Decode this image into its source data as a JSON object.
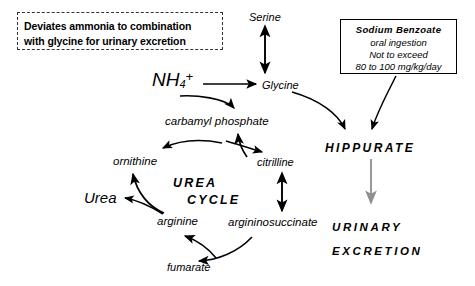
{
  "diagram": {
    "note_box": {
      "line1": "Deviates ammonia to combination",
      "line2": "with glycine for urinary excretion",
      "border_style": "dashed",
      "border_color": "#333333"
    },
    "drug_box": {
      "title": "Sodium  Benzoate",
      "line2": "oral  ingestion",
      "line3": "Not to exceed",
      "line4": "80 to 100 mg/kg/day",
      "border_style": "solid",
      "border_color": "#000000"
    },
    "nodes": {
      "serine": "Serine",
      "glycine": "Glycine",
      "ammonium": "NH",
      "ammonium_sub": "4",
      "ammonium_sup": "+",
      "carbamyl_phosphate": "carbamyl  phosphate",
      "ornithine": "ornithine",
      "citrulline": "citrilline",
      "arginine": "arginine",
      "argininosuccinate": "argininosuccinate",
      "fumarate": "fumarate",
      "urea": "Urea",
      "cycle_label_line1": "UREA",
      "cycle_label_line2": "CYCLE",
      "hippurate": "HIPPURATE",
      "urinary_line1": "URINARY",
      "urinary_line2": "EXCRETION"
    },
    "colors": {
      "ink": "#000000",
      "grey_arrow": "#9a9a9a",
      "background": "#ffffff"
    },
    "edges": [
      {
        "from": "serine",
        "to": "glycine",
        "type": "double-headed-straight"
      },
      {
        "from": "ammonium",
        "to": "glycine",
        "type": "straight"
      },
      {
        "from": "ammonium",
        "to": "carbamyl_phosphate",
        "type": "curved"
      },
      {
        "from": "glycine",
        "to": "hippurate",
        "type": "curved"
      },
      {
        "from": "drug_box",
        "to": "hippurate",
        "type": "curved"
      },
      {
        "from": "hippurate",
        "to": "urinary_excretion",
        "type": "straight-grey"
      },
      {
        "from": "carbamyl_phosphate",
        "to": "citrulline",
        "type": "curved"
      },
      {
        "from": "citrulline",
        "to": "carbamyl_phosphate",
        "type": "curved"
      },
      {
        "from": "carbamyl_phosphate",
        "to": "ornithine",
        "type": "curved"
      },
      {
        "from": "citrulline",
        "to": "argininosuccinate",
        "type": "double-headed-straight"
      },
      {
        "from": "argininosuccinate",
        "to": "fumarate",
        "type": "curved"
      },
      {
        "from": "fumarate",
        "to": "arginine",
        "type": "curved"
      },
      {
        "from": "arginine",
        "to": "ornithine",
        "type": "curved"
      },
      {
        "from": "arginine",
        "to": "urea",
        "type": "curved"
      }
    ]
  }
}
